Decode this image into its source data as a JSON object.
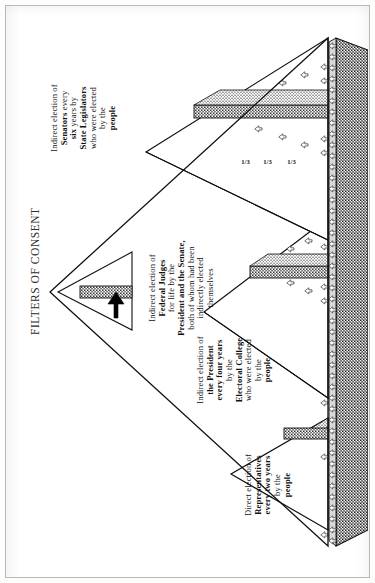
{
  "page": {
    "title": "FILTERS OF CONSENT"
  },
  "diagram": {
    "type": "pyramid-diagram",
    "orientation": "rotated-90-ccw",
    "apex_icon": "black-arrow-icon",
    "labels": [
      {
        "id": "senators",
        "lines": [
          {
            "text": "Indirect election of",
            "bold": false
          },
          {
            "text": "Senators",
            "bold": true,
            "suffix": " every"
          },
          {
            "text": "six",
            "bold": true,
            "suffix": " years by"
          },
          {
            "text": "State Legislators",
            "bold": true
          },
          {
            "text": "who were elected",
            "bold": false
          },
          {
            "text": "by the",
            "bold": false
          },
          {
            "text": "people",
            "bold": true
          }
        ],
        "full_text": "Indirect election of Senators every six years by State Legislators who were elected by the people"
      },
      {
        "id": "federal-judges",
        "lines": [
          {
            "text": "Indirect election of",
            "bold": false
          },
          {
            "text": "Federal Judges",
            "bold": true
          },
          {
            "text": "for life",
            "bold": false,
            "suffix": " by the"
          },
          {
            "text": "President and the Senate,",
            "bold": true
          },
          {
            "text": "both of whom had been",
            "bold": false
          },
          {
            "text": "indirectly elected",
            "bold": false
          },
          {
            "text": "themselves",
            "bold": false
          }
        ],
        "full_text": "Indirect election of Federal Judges for life by the President and the Senate, both of whom had been indirectly elected themselves"
      },
      {
        "id": "president",
        "lines": [
          {
            "text": "Indirect election of",
            "bold": false
          },
          {
            "text": "the President",
            "bold": true
          },
          {
            "text": "every four years",
            "bold": true
          },
          {
            "text": "by the",
            "bold": false
          },
          {
            "text": "Electoral College",
            "bold": true
          },
          {
            "text": "who were elected",
            "bold": false
          },
          {
            "text": "by the",
            "bold": false
          },
          {
            "text": "people",
            "bold": true
          }
        ],
        "full_text": "Indirect election of the President every four years by the Electoral College who were elected by the people"
      },
      {
        "id": "representatives",
        "lines": [
          {
            "text": "Direct election of",
            "bold": false
          },
          {
            "text": "Representatives",
            "bold": true
          },
          {
            "text": "every two years",
            "bold": true
          },
          {
            "text": "by the",
            "bold": false
          },
          {
            "text": "people",
            "bold": true
          }
        ],
        "full_text": "Direct election of Representatives every two years by the people"
      }
    ],
    "fractions": [
      "1/3",
      "1/3",
      "1/3"
    ],
    "colors": {
      "ink": "#111111",
      "stipple_dark": "#6b6b6b",
      "stipple_mid": "#8e8e8e",
      "stipple_light": "#b4b4b4",
      "frame": "#b9b9b9",
      "paper": "#ffffff"
    },
    "counts": {
      "base_people_figures": 46,
      "second_tier_figures": 11,
      "third_tier_figures": 5,
      "senate_tier_figures": 9
    }
  }
}
